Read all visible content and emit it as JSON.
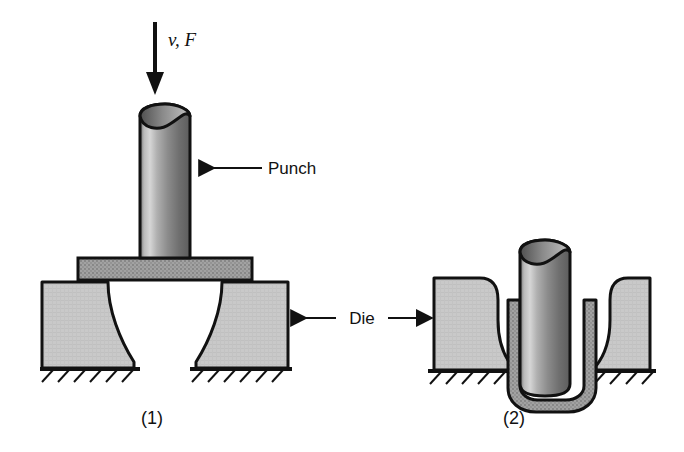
{
  "figure": {
    "process_type": "sheet-metal deep drawing",
    "background_color": "#ffffff",
    "line_color": "#111111"
  },
  "labels": {
    "force_velocity": "v, F",
    "punch": "Punch",
    "die": "Die",
    "stage_one": "(1)",
    "stage_two": "(2)"
  },
  "colors": {
    "die_fill": "#c9c9c9",
    "blank_fill": "#a0a0a0",
    "punch_light": "#d8d8d8",
    "punch_mid": "#8f8f8f",
    "punch_dark": "#5a5a5a",
    "outline": "#111111",
    "ground_hatch": "#111111"
  },
  "stages": [
    {
      "id": "stage-1",
      "caption": "(1)",
      "description": "Punch above the flat sheet-metal blank resting on the open die; v, F arrow shows downward punch velocity and force.",
      "components": [
        "punch",
        "blank",
        "die-left",
        "die-right",
        "ground"
      ]
    },
    {
      "id": "stage-2",
      "caption": "(2)",
      "description": "Punch driven down through the die opening, drawing the blank into a cup around the punch.",
      "components": [
        "punch",
        "drawn-cup",
        "die-left",
        "die-right",
        "ground"
      ]
    }
  ],
  "annotations": [
    {
      "name": "force-velocity-arrow",
      "text": "v, F",
      "direction": "down",
      "target": "punch-top"
    },
    {
      "name": "punch-callout",
      "text": "Punch",
      "direction": "left",
      "target": "punch-body"
    },
    {
      "name": "die-callout-left",
      "text": "Die",
      "direction": "left",
      "target": "die-right-of-stage-1"
    },
    {
      "name": "die-callout-right",
      "text": "Die",
      "direction": "right",
      "target": "die-left-of-stage-2"
    }
  ]
}
